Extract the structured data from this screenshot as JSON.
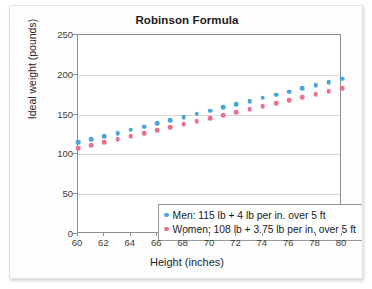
{
  "chart_data": {
    "type": "scatter",
    "title": "Robinson Formula",
    "xlabel": "Height (inches)",
    "ylabel": "Ideal weight (pounds)",
    "xlim": [
      60,
      80
    ],
    "ylim": [
      0,
      250
    ],
    "xticks": [
      60,
      62,
      64,
      66,
      68,
      70,
      72,
      74,
      76,
      78,
      80
    ],
    "yticks": [
      0,
      50,
      100,
      150,
      200,
      250
    ],
    "grid": "horizontal",
    "legend_position": "lower-left-inside",
    "colors": {
      "men": "#4BA5DB",
      "women": "#E8738F"
    },
    "x": [
      60,
      61,
      62,
      63,
      64,
      65,
      66,
      67,
      68,
      69,
      70,
      71,
      72,
      73,
      74,
      75,
      76,
      77,
      78,
      79,
      80
    ],
    "series": [
      {
        "name": "Men: 115 lb + 4 lb per in. over 5 ft",
        "short_name": "Men",
        "color": "#4BA5DB",
        "values": [
          115,
          119,
          123,
          127,
          131,
          135,
          139,
          143,
          147,
          151,
          155,
          159,
          163,
          167,
          171,
          175,
          179,
          183,
          187,
          191,
          195
        ]
      },
      {
        "name": "Women: 108 lb + 3.75 lb per in. over 5 ft",
        "short_name": "Women",
        "color": "#E8738F",
        "values": [
          108,
          111.75,
          115.5,
          119.25,
          123,
          126.75,
          130.5,
          134.25,
          138,
          141.75,
          145.5,
          149.25,
          153,
          156.75,
          160.5,
          164.25,
          168,
          171.75,
          175.5,
          179.25,
          183
        ]
      }
    ]
  }
}
